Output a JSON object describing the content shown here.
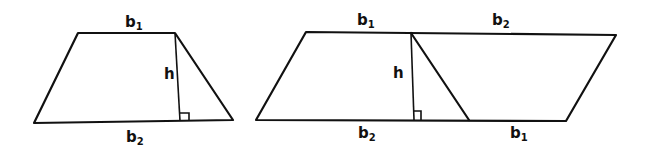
{
  "diagram": {
    "colors": {
      "stroke": "#111111",
      "background": "#ffffff"
    },
    "trapezoid": {
      "labels": {
        "top_base": {
          "main": "b",
          "sub": "1"
        },
        "bottom_base": {
          "main": "b",
          "sub": "2"
        },
        "height": "h"
      }
    },
    "parallelogram": {
      "labels": {
        "top_left": {
          "main": "b",
          "sub": "1"
        },
        "top_right": {
          "main": "b",
          "sub": "2"
        },
        "bottom_left": {
          "main": "b",
          "sub": "2"
        },
        "bottom_right": {
          "main": "b",
          "sub": "1"
        },
        "height": "h"
      }
    }
  }
}
